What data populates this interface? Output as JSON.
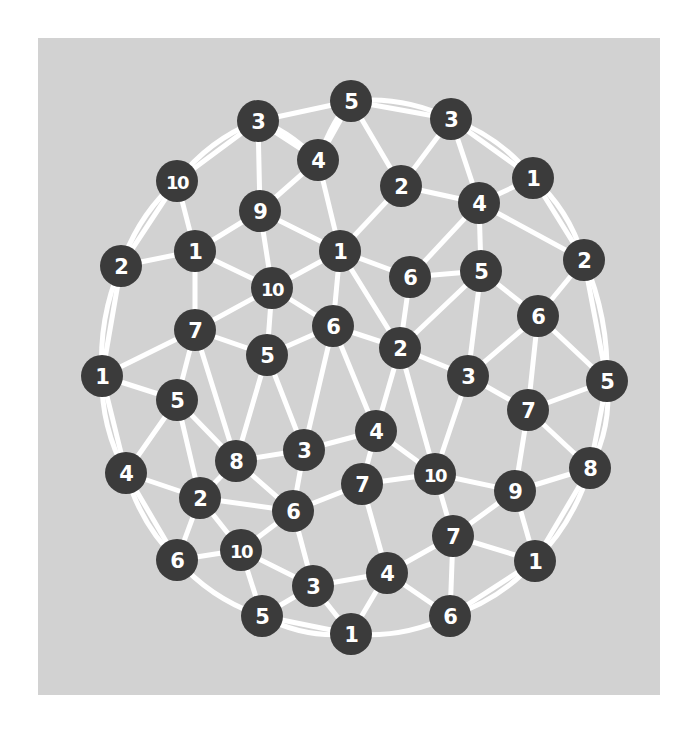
{
  "figure": {
    "title": "",
    "background_color": "#ffffff",
    "canvas_color": "#d2d2d2",
    "node_color": "#3b3b3b",
    "node_label_color": "#ffffff",
    "edge_color": "#ffffff",
    "node_radius": 21,
    "edge_width": 5
  },
  "chart_data": {
    "type": "scatter",
    "title": "",
    "xlabel": "",
    "ylabel": "",
    "grid": false,
    "legend": false,
    "node_count": 52,
    "edge_count": 104,
    "label_values": [
      5,
      3,
      3,
      10,
      4,
      2,
      1,
      9,
      1,
      2,
      1,
      4,
      10,
      2,
      1,
      6,
      5,
      2,
      7,
      6,
      6,
      5,
      5,
      2,
      1,
      3,
      6,
      5,
      3,
      7,
      4,
      8,
      3,
      4,
      5,
      2,
      10,
      6,
      7,
      10,
      9,
      8,
      4,
      6,
      10,
      7,
      7,
      1,
      3,
      5,
      4,
      6,
      1
    ],
    "nodes": [
      {
        "id": 0,
        "label": "5",
        "x": 313,
        "y": 63
      },
      {
        "id": 1,
        "label": "3",
        "x": 220,
        "y": 83
      },
      {
        "id": 2,
        "label": "3",
        "x": 413,
        "y": 81
      },
      {
        "id": 3,
        "label": "10",
        "x": 139,
        "y": 143
      },
      {
        "id": 4,
        "label": "4",
        "x": 280,
        "y": 122
      },
      {
        "id": 5,
        "label": "2",
        "x": 363,
        "y": 148
      },
      {
        "id": 6,
        "label": "1",
        "x": 495,
        "y": 140
      },
      {
        "id": 7,
        "label": "9",
        "x": 222,
        "y": 173
      },
      {
        "id": 8,
        "label": "4",
        "x": 441,
        "y": 165
      },
      {
        "id": 9,
        "label": "2",
        "x": 83,
        "y": 228
      },
      {
        "id": 10,
        "label": "1",
        "x": 157,
        "y": 213
      },
      {
        "id": 11,
        "label": "1",
        "x": 302,
        "y": 213
      },
      {
        "id": 12,
        "label": "10",
        "x": 234,
        "y": 250
      },
      {
        "id": 13,
        "label": "2",
        "x": 546,
        "y": 222
      },
      {
        "id": 14,
        "label": "6",
        "x": 372,
        "y": 239
      },
      {
        "id": 15,
        "label": "5",
        "x": 443,
        "y": 233
      },
      {
        "id": 16,
        "label": "7",
        "x": 157,
        "y": 292
      },
      {
        "id": 17,
        "label": "6",
        "x": 500,
        "y": 278
      },
      {
        "id": 18,
        "label": "1",
        "x": 64,
        "y": 338
      },
      {
        "id": 19,
        "label": "6",
        "x": 295,
        "y": 288
      },
      {
        "id": 20,
        "label": "5",
        "x": 229,
        "y": 317
      },
      {
        "id": 21,
        "label": "2",
        "x": 362,
        "y": 310
      },
      {
        "id": 22,
        "label": "3",
        "x": 430,
        "y": 338
      },
      {
        "id": 23,
        "label": "5",
        "x": 569,
        "y": 343
      },
      {
        "id": 24,
        "label": "5",
        "x": 139,
        "y": 362
      },
      {
        "id": 25,
        "label": "7",
        "x": 490,
        "y": 372
      },
      {
        "id": 26,
        "label": "8",
        "x": 198,
        "y": 423
      },
      {
        "id": 27,
        "label": "3",
        "x": 266,
        "y": 412
      },
      {
        "id": 28,
        "label": "4",
        "x": 338,
        "y": 393
      },
      {
        "id": 29,
        "label": "4",
        "x": 88,
        "y": 435
      },
      {
        "id": 30,
        "label": "10",
        "x": 397,
        "y": 436
      },
      {
        "id": 31,
        "label": "8",
        "x": 552,
        "y": 430
      },
      {
        "id": 32,
        "label": "2",
        "x": 162,
        "y": 460
      },
      {
        "id": 33,
        "label": "7",
        "x": 324,
        "y": 446
      },
      {
        "id": 34,
        "label": "6",
        "x": 255,
        "y": 473
      },
      {
        "id": 35,
        "label": "9",
        "x": 477,
        "y": 453
      },
      {
        "id": 36,
        "label": "10",
        "x": 203,
        "y": 512
      },
      {
        "id": 37,
        "label": "6",
        "x": 139,
        "y": 522
      },
      {
        "id": 38,
        "label": "7",
        "x": 415,
        "y": 498
      },
      {
        "id": 39,
        "label": "1",
        "x": 497,
        "y": 523
      },
      {
        "id": 40,
        "label": "4",
        "x": 349,
        "y": 535
      },
      {
        "id": 41,
        "label": "3",
        "x": 275,
        "y": 548
      },
      {
        "id": 42,
        "label": "5",
        "x": 224,
        "y": 578
      },
      {
        "id": 43,
        "label": "6",
        "x": 412,
        "y": 578
      },
      {
        "id": 44,
        "label": "1",
        "x": 313,
        "y": 596
      }
    ],
    "edges": [
      [
        0,
        1
      ],
      [
        0,
        4
      ],
      [
        0,
        2
      ],
      [
        0,
        5
      ],
      [
        1,
        3
      ],
      [
        1,
        7
      ],
      [
        1,
        4
      ],
      [
        2,
        5
      ],
      [
        2,
        8
      ],
      [
        2,
        6
      ],
      [
        3,
        10
      ],
      [
        3,
        9
      ],
      [
        4,
        7
      ],
      [
        4,
        11
      ],
      [
        5,
        8
      ],
      [
        5,
        11
      ],
      [
        6,
        8
      ],
      [
        6,
        13
      ],
      [
        7,
        10
      ],
      [
        7,
        12
      ],
      [
        7,
        11
      ],
      [
        8,
        15
      ],
      [
        8,
        13
      ],
      [
        8,
        14
      ],
      [
        9,
        10
      ],
      [
        9,
        18
      ],
      [
        10,
        12
      ],
      [
        10,
        16
      ],
      [
        11,
        12
      ],
      [
        11,
        14
      ],
      [
        11,
        19
      ],
      [
        11,
        21
      ],
      [
        12,
        16
      ],
      [
        12,
        20
      ],
      [
        12,
        19
      ],
      [
        13,
        17
      ],
      [
        13,
        23
      ],
      [
        14,
        15
      ],
      [
        14,
        21
      ],
      [
        15,
        17
      ],
      [
        15,
        21
      ],
      [
        15,
        22
      ],
      [
        16,
        18
      ],
      [
        16,
        20
      ],
      [
        16,
        24
      ],
      [
        16,
        26
      ],
      [
        17,
        22
      ],
      [
        17,
        23
      ],
      [
        17,
        25
      ],
      [
        18,
        24
      ],
      [
        18,
        29
      ],
      [
        19,
        20
      ],
      [
        19,
        21
      ],
      [
        19,
        27
      ],
      [
        19,
        28
      ],
      [
        20,
        26
      ],
      [
        20,
        27
      ],
      [
        21,
        22
      ],
      [
        21,
        28
      ],
      [
        21,
        30
      ],
      [
        22,
        25
      ],
      [
        22,
        30
      ],
      [
        23,
        25
      ],
      [
        23,
        31
      ],
      [
        24,
        26
      ],
      [
        24,
        29
      ],
      [
        24,
        32
      ],
      [
        25,
        31
      ],
      [
        25,
        35
      ],
      [
        26,
        27
      ],
      [
        26,
        32
      ],
      [
        26,
        34
      ],
      [
        27,
        28
      ],
      [
        27,
        34
      ],
      [
        28,
        30
      ],
      [
        28,
        33
      ],
      [
        29,
        32
      ],
      [
        29,
        37
      ],
      [
        30,
        33
      ],
      [
        30,
        35
      ],
      [
        30,
        38
      ],
      [
        31,
        35
      ],
      [
        31,
        39
      ],
      [
        32,
        34
      ],
      [
        32,
        36
      ],
      [
        32,
        37
      ],
      [
        33,
        34
      ],
      [
        33,
        40
      ],
      [
        34,
        36
      ],
      [
        34,
        41
      ],
      [
        35,
        38
      ],
      [
        35,
        39
      ],
      [
        36,
        37
      ],
      [
        36,
        41
      ],
      [
        36,
        42
      ],
      [
        38,
        39
      ],
      [
        38,
        40
      ],
      [
        38,
        43
      ],
      [
        39,
        43
      ],
      [
        40,
        41
      ],
      [
        40,
        43
      ],
      [
        40,
        44
      ],
      [
        41,
        42
      ],
      [
        41,
        44
      ],
      [
        42,
        44
      ]
    ]
  }
}
